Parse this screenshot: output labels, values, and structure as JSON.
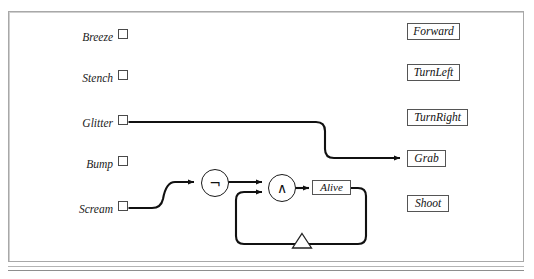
{
  "figure": {
    "kind": "circuit-based-agent-diagram",
    "background_color": "#ffffff",
    "frame_border_color": "#a8a8a8",
    "wire_color": "#111111",
    "gate_border_color": "#1a1a1a",
    "box_border_color": "#555555"
  },
  "sensors": [
    {
      "label": "Breeze",
      "checkbox_state": "unchecked",
      "wired": false
    },
    {
      "label": "Stench",
      "checkbox_state": "unchecked",
      "wired": false
    },
    {
      "label": "Glitter",
      "checkbox_state": "unchecked",
      "wired": true
    },
    {
      "label": "Bump",
      "checkbox_state": "unchecked",
      "wired": false
    },
    {
      "label": "Scream",
      "checkbox_state": "unchecked",
      "wired": true
    }
  ],
  "actions": [
    {
      "label": "Forward",
      "wired": false
    },
    {
      "label": "TurnLeft",
      "wired": false
    },
    {
      "label": "TurnRight",
      "wired": false
    },
    {
      "label": "Grab",
      "wired": true
    },
    {
      "label": "Shoot",
      "wired": false
    }
  ],
  "gates": [
    {
      "id": "not-gate",
      "symbol": "¬",
      "name": "not-gate",
      "inputs": 1,
      "outputs": 1
    },
    {
      "id": "and-gate",
      "symbol": "∧",
      "name": "and-gate",
      "inputs": 2,
      "outputs": 1
    }
  ],
  "state": {
    "register_label": "Alive",
    "delay_symbol": "triangle",
    "delay_name": "delay-element"
  },
  "connections": [
    {
      "from": "Glitter",
      "to": "Grab",
      "arrow": true
    },
    {
      "from": "Scream",
      "to": "not-gate",
      "arrow": true
    },
    {
      "from": "not-gate",
      "to": "and-gate",
      "arrow": true
    },
    {
      "from": "and-gate",
      "to": "Alive",
      "arrow": true
    },
    {
      "from": "Alive",
      "to": "delay-element",
      "arrow": false
    },
    {
      "from": "delay-element",
      "to": "and-gate",
      "arrow": true
    }
  ]
}
